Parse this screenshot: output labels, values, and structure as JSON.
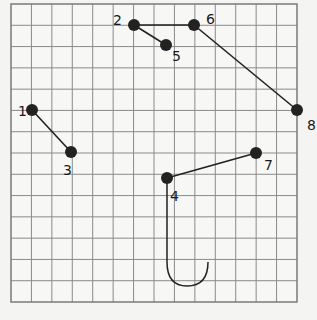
{
  "grid": {
    "left": 11,
    "top": 4,
    "right": 297,
    "bottom": 302,
    "cols": 14,
    "rows": 14,
    "line_color": "#8a8a8a",
    "border_color": "#7a7a7a",
    "background": "#f7f7f5"
  },
  "points": [
    {
      "id": "1",
      "label": "1",
      "x": 32,
      "y": 110,
      "lx": -14,
      "ly": 6
    },
    {
      "id": "2",
      "label": "2",
      "x": 134,
      "y": 25,
      "lx": -21,
      "ly": 0
    },
    {
      "id": "3",
      "label": "3",
      "x": 71,
      "y": 152,
      "lx": -8,
      "ly": 23
    },
    {
      "id": "4",
      "label": "4",
      "x": 167,
      "y": 178,
      "lx": 3,
      "ly": 23
    },
    {
      "id": "5",
      "label": "5",
      "x": 166,
      "y": 45,
      "lx": 6,
      "ly": 16
    },
    {
      "id": "6",
      "label": "6",
      "x": 194,
      "y": 25,
      "lx": 12,
      "ly": -1
    },
    {
      "id": "7",
      "label": "7",
      "x": 256,
      "y": 153,
      "lx": 8,
      "ly": 17
    },
    {
      "id": "8",
      "label": "8",
      "x": 297,
      "y": 110,
      "lx": 10,
      "ly": 20
    }
  ],
  "segments": [
    {
      "from": "1",
      "to": "3"
    },
    {
      "from": "2",
      "to": "6"
    },
    {
      "from": "2",
      "to": "5"
    },
    {
      "from": "6",
      "to": "8"
    },
    {
      "from": "4",
      "to": "7"
    }
  ],
  "hook": {
    "from": "4",
    "path": "M167,178 L167,262 Q167,286 187,286 Q208,286 208,262"
  },
  "style": {
    "point_color": "#222222",
    "line_color": "#222222",
    "point_radius": 6
  }
}
